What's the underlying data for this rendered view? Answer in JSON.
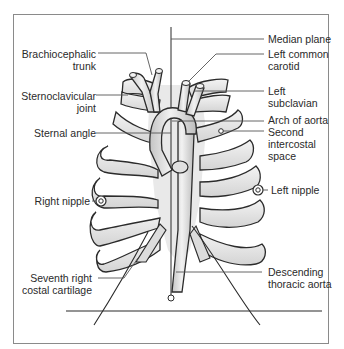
{
  "diagram": {
    "type": "anatomical illustration",
    "labels_left": [
      {
        "id": "brachiocephalic",
        "line1": "Brachiocephalic",
        "line2": "trunk"
      },
      {
        "id": "sternoclavicular",
        "line1": "Sternoclavicular",
        "line2": "joint"
      },
      {
        "id": "sternal-angle",
        "line1": "Sternal angle"
      },
      {
        "id": "right-nipple",
        "line1": "Right nipple"
      },
      {
        "id": "seventh-costal",
        "line1": "Seventh right",
        "line2": "costal cartilage"
      }
    ],
    "labels_right": [
      {
        "id": "median-plane",
        "line1": "Median plane"
      },
      {
        "id": "left-common-carotid",
        "line1": "Left common",
        "line2": "carotid"
      },
      {
        "id": "left-subclavian",
        "line1": "Left",
        "line2": "subclavian"
      },
      {
        "id": "arch-of-aorta",
        "line1": "Arch of aorta"
      },
      {
        "id": "second-intercostal",
        "line1": "Second",
        "line2": "intercostal",
        "line3": "space"
      },
      {
        "id": "left-nipple",
        "line1": "Left nipple"
      },
      {
        "id": "descending-aorta",
        "line1": "Descending",
        "line2": "thoracic aorta"
      }
    ],
    "colors": {
      "outline": "#2b2b2b",
      "bone_fill": "#e4e4e4",
      "vessel_fill": "#d2d2d2",
      "leader": "#555555",
      "frame": "#8a8a8a"
    }
  }
}
